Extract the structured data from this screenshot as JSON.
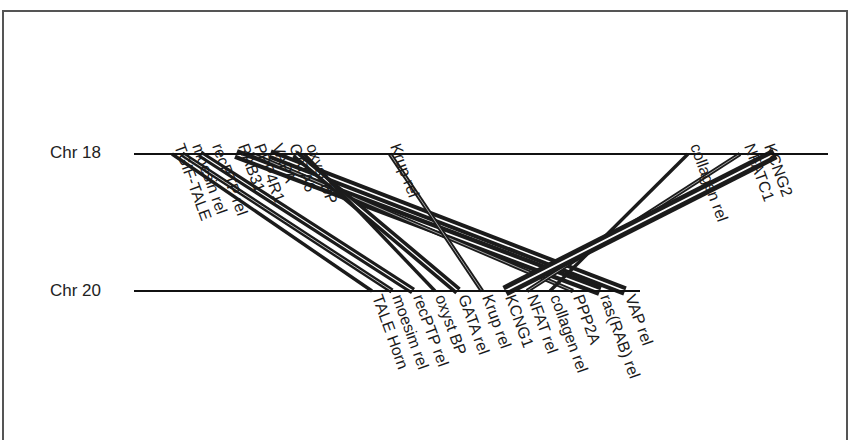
{
  "diagram": {
    "type": "synteny",
    "chromosomes": [
      {
        "id": "chr18",
        "label": "Chr 18",
        "y": 154,
        "x1": 134,
        "x2": 828
      },
      {
        "id": "chr20",
        "label": "Chr 20",
        "y": 291,
        "x1": 134,
        "x2": 640
      }
    ],
    "chr18_genes": [
      {
        "label": "TGIF-TALE",
        "x": 172
      },
      {
        "label": "moesin rel",
        "x": 190
      },
      {
        "label": "recPTP rel",
        "x": 210
      },
      {
        "label": "RAB31",
        "x": 236
      },
      {
        "label": "PPP4R1",
        "x": 252
      },
      {
        "label": "VAPA",
        "x": 270
      },
      {
        "label": "GATA6",
        "x": 287
      },
      {
        "label": "oxyst BP",
        "x": 304
      },
      {
        "label": "Krup rel",
        "x": 388
      },
      {
        "label": "collagen rel",
        "x": 688
      },
      {
        "label": "NFATC1",
        "x": 742
      },
      {
        "label": "KCNG2",
        "x": 762
      }
    ],
    "chr20_genes": [
      {
        "label": "TALE Horn",
        "x": 372
      },
      {
        "label": "moesim rel",
        "x": 392
      },
      {
        "label": "recPTP rel",
        "x": 413
      },
      {
        "label": "oxyst BP",
        "x": 435
      },
      {
        "label": "GATA rel",
        "x": 458
      },
      {
        "label": "Krup rel",
        "x": 482
      },
      {
        "label": "KCNG1",
        "x": 505
      },
      {
        "label": "NFAT rel",
        "x": 527
      },
      {
        "label": "collagen rel",
        "x": 550
      },
      {
        "label": "PPP2A",
        "x": 573
      },
      {
        "label": "ras(RAB) rel",
        "x": 600
      },
      {
        "label": "VAP rel",
        "x": 625
      }
    ],
    "links": [
      {
        "from": "TGIF-TALE",
        "to": "TALE Horn",
        "x1": 172,
        "x2": 372,
        "w": 2
      },
      {
        "from": "moesin rel",
        "to": "moesim rel",
        "x1": 182,
        "x2": 392,
        "w": 4
      },
      {
        "from": "recPTP rel",
        "to": "recPTP rel",
        "x1": 200,
        "x2": 413,
        "w": 6
      },
      {
        "from": "RAB31",
        "to": "ras(RAB) rel",
        "x1": 236,
        "x2": 600,
        "w": 9
      },
      {
        "from": "PPP4R1",
        "to": "PPP2A",
        "x1": 252,
        "x2": 573,
        "w": 3
      },
      {
        "from": "VAPA",
        "to": "VAP rel",
        "x1": 270,
        "x2": 625,
        "w": 8
      },
      {
        "from": "GATA6",
        "to": "GATA rel",
        "x1": 295,
        "x2": 458,
        "w": 7
      },
      {
        "from": "oxyst BP",
        "to": "oxyst BP",
        "x1": 304,
        "x2": 435,
        "w": 2
      },
      {
        "from": "Krup rel",
        "to": "Krup rel",
        "x1": 390,
        "x2": 482,
        "w": 3
      },
      {
        "from": "collagen rel",
        "to": "collagen rel",
        "x1": 688,
        "x2": 550,
        "w": 2
      },
      {
        "from": "NFATC1",
        "to": "NFAT rel",
        "x1": 740,
        "x2": 527,
        "w": 3
      },
      {
        "from": "KCNG2",
        "to": "KCNG1",
        "x1": 775,
        "x2": 505,
        "w": 10
      }
    ]
  }
}
